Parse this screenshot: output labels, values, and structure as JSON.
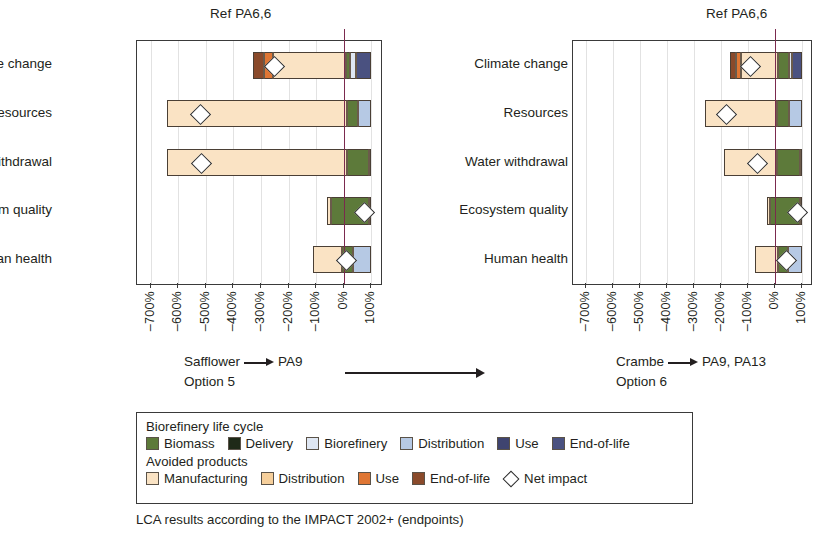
{
  "chart_data": {
    "type": "bar",
    "title": "LCA results according to the IMPACT 2002+ (endpoints)",
    "xlabel": "",
    "ylabel": "",
    "xlim": [
      -750,
      135
    ],
    "xticks": [
      -700,
      -600,
      -500,
      -400,
      -300,
      -200,
      -100,
      0,
      100
    ],
    "xticklabels": [
      "–700%",
      "–600%",
      "–500%",
      "–400%",
      "–300%",
      "–200%",
      "–100%",
      "0%",
      "100%"
    ],
    "grid": true,
    "legend_position": "bottom",
    "reference_line": {
      "label": "Ref PA6,6",
      "value": 0,
      "color": "#7b2a4e"
    },
    "categories": [
      "Climate change",
      "Resources",
      "Water withdrawal",
      "Ecosystem quality",
      "Human health"
    ],
    "series": [
      {
        "name": "Biomass",
        "group": "Biorefinery life cycle",
        "color": "#5d7a3a"
      },
      {
        "name": "Delivery",
        "group": "Biorefinery life cycle",
        "color": "#1f2a18"
      },
      {
        "name": "Biorefinery",
        "group": "Biorefinery life cycle",
        "color": "#dfe7f3"
      },
      {
        "name": "Distribution",
        "group": "Biorefinery life cycle",
        "color": "#b6c9e4"
      },
      {
        "name": "Use",
        "group": "Biorefinery life cycle",
        "color": "#3f4470"
      },
      {
        "name": "End-of-life",
        "group": "Biorefinery life cycle",
        "color": "#4a5180"
      },
      {
        "name": "Manufacturing",
        "group": "Avoided products",
        "color": "#fae3c4"
      },
      {
        "name": "Distribution (avoided)",
        "group": "Avoided products",
        "color": "#f6cf9b"
      },
      {
        "name": "Use (avoided)",
        "group": "Avoided products",
        "color": "#df7634"
      },
      {
        "name": "End-of-life (avoided)",
        "group": "Avoided products",
        "color": "#8a4a2b"
      },
      {
        "name": "Net impact",
        "group": "Avoided products",
        "color": "#ffffff"
      }
    ],
    "panels": [
      {
        "id": "option5",
        "caption_line1_from": "Safflower",
        "caption_line1_to": "PA9",
        "caption_line2": "Option 5",
        "rows": [
          {
            "category": "Climate change",
            "net": -255,
            "segments": [
              {
                "key": "eol_avoided",
                "start": -330,
                "end": -290
              },
              {
                "key": "use_avoided",
                "start": -290,
                "end": -255
              },
              {
                "key": "manufacturing",
                "start": -255,
                "end": 10
              },
              {
                "key": "biomass",
                "start": 10,
                "end": 22
              },
              {
                "key": "biorefinery",
                "start": 22,
                "end": 45
              },
              {
                "key": "endoflife",
                "start": 45,
                "end": 100
              }
            ]
          },
          {
            "category": "Resources",
            "net": -522,
            "segments": [
              {
                "key": "manufacturing",
                "start": -640,
                "end": 10
              },
              {
                "key": "biomass",
                "start": 10,
                "end": 50
              },
              {
                "key": "distribution",
                "start": 50,
                "end": 100
              }
            ]
          },
          {
            "category": "Water withdrawal",
            "net": -520,
            "segments": [
              {
                "key": "manufacturing",
                "start": -640,
                "end": 10
              },
              {
                "key": "biomass",
                "start": 10,
                "end": 92
              },
              {
                "key": "distribution",
                "start": 92,
                "end": 100
              }
            ]
          },
          {
            "category": "Ecosystem quality",
            "net": 72,
            "segments": [
              {
                "key": "manufacturing",
                "start": -60,
                "end": -48
              },
              {
                "key": "biomass",
                "start": -48,
                "end": 92
              },
              {
                "key": "distribution",
                "start": 92,
                "end": 100
              }
            ]
          },
          {
            "category": "Human health",
            "net": 5,
            "segments": [
              {
                "key": "manufacturing",
                "start": -110,
                "end": -5
              },
              {
                "key": "biomass",
                "start": -5,
                "end": 32
              },
              {
                "key": "distribution",
                "start": 32,
                "end": 100
              }
            ]
          }
        ]
      },
      {
        "id": "option6",
        "caption_line1_from": "Crambe",
        "caption_line1_to": "PA9, PA13",
        "caption_line2": "Option 6",
        "rows": [
          {
            "category": "Climate change",
            "net": -95,
            "segments": [
              {
                "key": "eol_avoided",
                "start": -165,
                "end": -145
              },
              {
                "key": "use_avoided",
                "start": -145,
                "end": -125
              },
              {
                "key": "manufacturing",
                "start": -125,
                "end": 12
              },
              {
                "key": "biomass",
                "start": 12,
                "end": 52
              },
              {
                "key": "biorefinery",
                "start": 52,
                "end": 66
              },
              {
                "key": "endoflife",
                "start": 66,
                "end": 100
              }
            ]
          },
          {
            "category": "Resources",
            "net": -182,
            "segments": [
              {
                "key": "manufacturing",
                "start": -260,
                "end": 10
              },
              {
                "key": "biomass",
                "start": 10,
                "end": 55
              },
              {
                "key": "distribution",
                "start": 55,
                "end": 100
              }
            ]
          },
          {
            "category": "Water withdrawal",
            "net": -68,
            "segments": [
              {
                "key": "manufacturing",
                "start": -190,
                "end": 10
              },
              {
                "key": "biomass",
                "start": 10,
                "end": 95
              },
              {
                "key": "distribution",
                "start": 95,
                "end": 100
              }
            ]
          },
          {
            "category": "Ecosystem quality",
            "net": 82,
            "segments": [
              {
                "key": "manufacturing",
                "start": -30,
                "end": -18
              },
              {
                "key": "biomass",
                "start": -18,
                "end": 94
              },
              {
                "key": "distribution",
                "start": 94,
                "end": 100
              }
            ]
          },
          {
            "category": "Human health",
            "net": 42,
            "segments": [
              {
                "key": "manufacturing",
                "start": -75,
                "end": 12
              },
              {
                "key": "biomass",
                "start": 12,
                "end": 48
              },
              {
                "key": "distribution",
                "start": 48,
                "end": 100
              }
            ]
          }
        ]
      }
    ]
  },
  "legend": {
    "group1_title": "Biorefinery life cycle",
    "group1_items": [
      {
        "label": "Biomass",
        "color": "#5d7a3a"
      },
      {
        "label": "Delivery",
        "color": "#1f2a18"
      },
      {
        "label": "Biorefinery",
        "color": "#dfe7f3"
      },
      {
        "label": "Distribution",
        "color": "#b6c9e4"
      },
      {
        "label": "Use",
        "color": "#3f4470"
      },
      {
        "label": "End-of-life",
        "color": "#4a5180"
      }
    ],
    "group2_title": "Avoided products",
    "group2_items": [
      {
        "label": "Manufacturing",
        "color": "#fae3c4"
      },
      {
        "label": "Distribution",
        "color": "#f6cf9b"
      },
      {
        "label": "Use",
        "color": "#df7634"
      },
      {
        "label": "End-of-life",
        "color": "#8a4a2b"
      }
    ],
    "net_impact_label": "Net impact"
  },
  "footnote": "LCA results according to the IMPACT 2002+ (endpoints)"
}
